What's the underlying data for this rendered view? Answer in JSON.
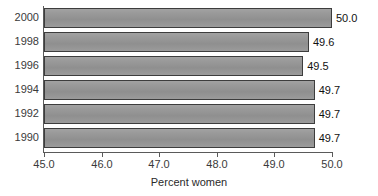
{
  "chart_data": {
    "type": "bar",
    "orientation": "horizontal",
    "title": "",
    "subtitle": "",
    "xlabel": "Percent women",
    "ylabel": "",
    "xlim": [
      45.0,
      50.0
    ],
    "xticks": [
      "45.0",
      "46.0",
      "47.0",
      "48.0",
      "49.0",
      "50.0"
    ],
    "xtick_values": [
      45.0,
      46.0,
      47.0,
      48.0,
      49.0,
      50.0
    ],
    "categories": [
      "2000",
      "1998",
      "1996",
      "1994",
      "1992",
      "1990"
    ],
    "values": [
      50.0,
      49.6,
      49.5,
      49.7,
      49.7,
      49.7
    ],
    "data_labels": [
      "50.0",
      "49.6",
      "49.5",
      "49.7",
      "49.7",
      "49.7"
    ],
    "grid": false,
    "legend": false,
    "bar_color": "#969696",
    "bar_border_color": "#3d3d3d",
    "axis_color": "#5a5a5a",
    "background": "#ffffff"
  }
}
